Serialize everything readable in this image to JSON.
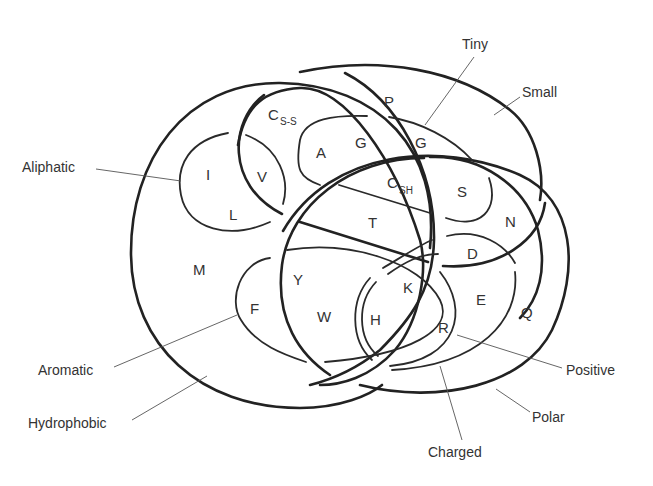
{
  "diagram": {
    "type": "venn",
    "categories": [
      {
        "id": "hydrophobic",
        "label": "Hydrophobic"
      },
      {
        "id": "aliphatic",
        "label": "Aliphatic"
      },
      {
        "id": "aromatic",
        "label": "Aromatic"
      },
      {
        "id": "small",
        "label": "Small"
      },
      {
        "id": "tiny",
        "label": "Tiny"
      },
      {
        "id": "polar",
        "label": "Polar"
      },
      {
        "id": "charged",
        "label": "Charged"
      },
      {
        "id": "positive",
        "label": "Positive"
      }
    ],
    "amino_acids": {
      "I": "I",
      "L": "L",
      "V": "V",
      "M": "M",
      "F": "F",
      "Y": "Y",
      "W": "W",
      "H": "H",
      "K": "K",
      "R": "R",
      "E": "E",
      "Q": "Q",
      "D": "D",
      "N": "N",
      "S": "S",
      "T": "T",
      "P": "P",
      "A": "A",
      "G_hydrophobic": "G",
      "G_tiny": "G",
      "C_ss": {
        "main": "C",
        "sub": "S-S"
      },
      "C_sh": {
        "main": "C",
        "sub": "SH"
      }
    }
  }
}
